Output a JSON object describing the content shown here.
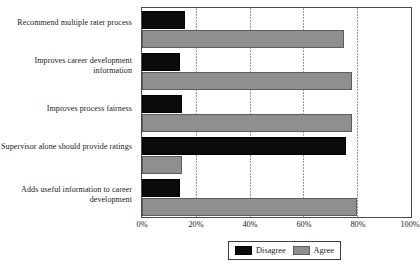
{
  "chart_data": {
    "type": "bar",
    "orientation": "horizontal",
    "title": "",
    "xlabel": "",
    "ylabel": "",
    "xlim": [
      0,
      100
    ],
    "xticks": [
      "0%",
      "20%",
      "40%",
      "60%",
      "80%",
      "100%"
    ],
    "xtick_values": [
      0,
      20,
      40,
      60,
      80,
      100
    ],
    "grid": true,
    "grid_axis": "x",
    "legend_position": "bottom",
    "categories": [
      "Recommend multiple rater process",
      "Improves career development information",
      "Improves process fairness",
      "Supervisor alone should provide ratings",
      "Adds useful information to career development"
    ],
    "series": [
      {
        "name": "Disagree",
        "color": "#0b0b0b",
        "values": [
          16,
          14,
          15,
          76,
          14
        ]
      },
      {
        "name": "Agree",
        "color": "#8f8f8f",
        "values": [
          75,
          78,
          78,
          15,
          80
        ]
      }
    ]
  },
  "legend": {
    "items": [
      {
        "label": "Disagree",
        "swatch": "disagree"
      },
      {
        "label": "Agree",
        "swatch": "agree"
      }
    ]
  }
}
